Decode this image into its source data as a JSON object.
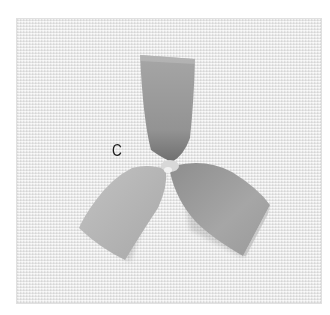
{
  "image": {
    "description": "Photograph of a folded ribbon bow with three loops on linen fabric",
    "label": "C",
    "colors": {
      "background": "#ffffff",
      "fabric": "#ebebeb",
      "ribbon_light": "#b8b8b8",
      "ribbon_mid": "#a0a0a0",
      "ribbon_dark": "#7e7e7e"
    }
  }
}
